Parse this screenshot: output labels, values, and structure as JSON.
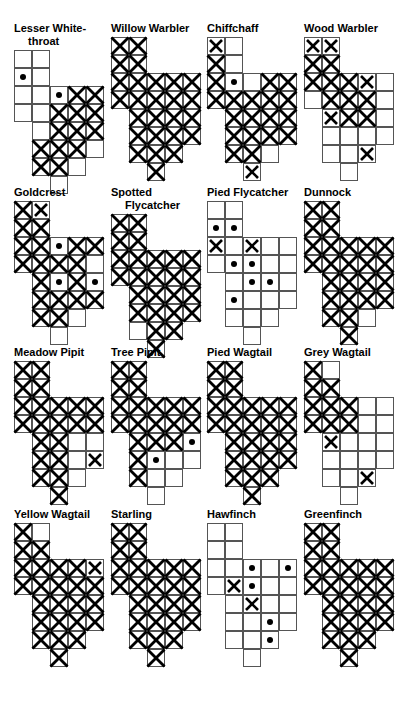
{
  "page": {
    "columns": 4,
    "rows": 4,
    "cell_px": 18,
    "grid_cols": 5,
    "grid_rows": 8,
    "colors": {
      "ink": "#000000",
      "gridline": "#555555",
      "background": "#ffffff"
    },
    "legend": {
      "empty": "absent / no record",
      "dot": "sparse - single dot",
      "cross": "present - single cross",
      "hatch": "abundant - full cross-hatch"
    }
  },
  "grid_shape": [
    [
      1,
      1,
      0,
      0,
      0
    ],
    [
      1,
      1,
      0,
      0,
      0
    ],
    [
      1,
      1,
      1,
      1,
      1
    ],
    [
      1,
      1,
      1,
      1,
      1
    ],
    [
      0,
      1,
      1,
      1,
      1
    ],
    [
      0,
      1,
      1,
      1,
      1
    ],
    [
      0,
      1,
      1,
      1,
      0
    ],
    [
      0,
      0,
      1,
      0,
      0
    ]
  ],
  "chart_data": {
    "type": "heatmap",
    "xlabel": "",
    "ylabel": "",
    "state_values": [
      "empty",
      "dot",
      "cross",
      "hatch"
    ],
    "panels": [
      {
        "name": "Lesser White-throat",
        "label_line1": "Lesser White-",
        "label_line2": "throat",
        "cells": [
          [
            "empty",
            "empty",
            "",
            "",
            ""
          ],
          [
            "dot",
            "empty",
            "",
            "",
            ""
          ],
          [
            "empty",
            "empty",
            "dot",
            "hatch",
            "hatch"
          ],
          [
            "empty",
            "empty",
            "hatch",
            "hatch",
            "hatch"
          ],
          [
            "",
            "empty",
            "hatch",
            "hatch",
            "hatch"
          ],
          [
            "",
            "hatch",
            "hatch",
            "hatch",
            "empty"
          ],
          [
            "",
            "hatch",
            "hatch",
            "empty",
            ""
          ],
          [
            "",
            "",
            "empty",
            "",
            ""
          ]
        ]
      },
      {
        "name": "Willow Warbler",
        "label_line1": "Willow Warbler",
        "label_line2": "",
        "cells": [
          [
            "hatch",
            "hatch",
            "",
            "",
            ""
          ],
          [
            "hatch",
            "hatch",
            "",
            "",
            ""
          ],
          [
            "hatch",
            "hatch",
            "hatch",
            "hatch",
            "hatch"
          ],
          [
            "hatch",
            "hatch",
            "hatch",
            "hatch",
            "hatch"
          ],
          [
            "",
            "hatch",
            "hatch",
            "hatch",
            "hatch"
          ],
          [
            "",
            "hatch",
            "hatch",
            "hatch",
            "hatch"
          ],
          [
            "",
            "hatch",
            "hatch",
            "hatch",
            ""
          ],
          [
            "",
            "",
            "hatch",
            "",
            ""
          ]
        ]
      },
      {
        "name": "Chiffchaff",
        "label_line1": "Chiffchaff",
        "label_line2": "",
        "cells": [
          [
            "cross",
            "empty",
            "",
            "",
            ""
          ],
          [
            "hatch",
            "empty",
            "",
            "",
            ""
          ],
          [
            "hatch",
            "dot",
            "empty",
            "hatch",
            "hatch"
          ],
          [
            "hatch",
            "hatch",
            "hatch",
            "hatch",
            "hatch"
          ],
          [
            "",
            "hatch",
            "hatch",
            "hatch",
            "hatch"
          ],
          [
            "",
            "hatch",
            "hatch",
            "hatch",
            "hatch"
          ],
          [
            "",
            "hatch",
            "hatch",
            "empty",
            ""
          ],
          [
            "",
            "",
            "cross",
            "",
            ""
          ]
        ]
      },
      {
        "name": "Wood Warbler",
        "label_line1": "Wood Warbler",
        "label_line2": "",
        "cells": [
          [
            "cross",
            "cross",
            "",
            "",
            ""
          ],
          [
            "hatch",
            "hatch",
            "",
            "",
            ""
          ],
          [
            "hatch",
            "hatch",
            "hatch",
            "cross",
            "empty"
          ],
          [
            "empty",
            "hatch",
            "hatch",
            "hatch",
            "empty"
          ],
          [
            "",
            "cross",
            "hatch",
            "hatch",
            "empty"
          ],
          [
            "",
            "empty",
            "empty",
            "empty",
            "empty"
          ],
          [
            "",
            "empty",
            "empty",
            "cross",
            ""
          ],
          [
            "",
            "",
            "empty",
            "",
            ""
          ]
        ]
      },
      {
        "name": "Goldcrest",
        "label_line1": "Goldcrest",
        "label_line2": "",
        "cells": [
          [
            "hatch",
            "cross",
            "",
            "",
            ""
          ],
          [
            "hatch",
            "hatch",
            "",
            "",
            ""
          ],
          [
            "hatch",
            "hatch",
            "dot",
            "hatch",
            "hatch"
          ],
          [
            "hatch",
            "hatch",
            "hatch",
            "hatch",
            "empty"
          ],
          [
            "",
            "hatch",
            "dot",
            "hatch",
            "dot"
          ],
          [
            "",
            "hatch",
            "hatch",
            "hatch",
            "hatch"
          ],
          [
            "",
            "hatch",
            "hatch",
            "empty",
            ""
          ],
          [
            "",
            "",
            "empty",
            "",
            ""
          ]
        ]
      },
      {
        "name": "Spotted Flycatcher",
        "label_line1": "Spotted",
        "label_line2": "Flycatcher",
        "cells": [
          [
            "hatch",
            "hatch",
            "",
            "",
            ""
          ],
          [
            "hatch",
            "hatch",
            "",
            "",
            ""
          ],
          [
            "hatch",
            "hatch",
            "hatch",
            "hatch",
            "hatch"
          ],
          [
            "hatch",
            "hatch",
            "hatch",
            "hatch",
            "hatch"
          ],
          [
            "",
            "hatch",
            "hatch",
            "hatch",
            "hatch"
          ],
          [
            "",
            "hatch",
            "hatch",
            "hatch",
            "hatch"
          ],
          [
            "",
            "empty",
            "hatch",
            "hatch",
            ""
          ],
          [
            "",
            "",
            "hatch",
            "",
            ""
          ]
        ]
      },
      {
        "name": "Pied Flycatcher",
        "label_line1": "Pied Flycatcher",
        "label_line2": "",
        "cells": [
          [
            "empty",
            "empty",
            "",
            "",
            ""
          ],
          [
            "dot",
            "dot",
            "",
            "",
            ""
          ],
          [
            "cross",
            "empty",
            "cross",
            "empty",
            "empty"
          ],
          [
            "empty",
            "dot",
            "dot",
            "empty",
            "empty"
          ],
          [
            "",
            "empty",
            "dot",
            "dot",
            "empty"
          ],
          [
            "",
            "dot",
            "empty",
            "empty",
            "empty"
          ],
          [
            "",
            "empty",
            "empty",
            "empty",
            ""
          ],
          [
            "",
            "",
            "empty",
            "",
            ""
          ]
        ]
      },
      {
        "name": "Dunnock",
        "label_line1": "Dunnock",
        "label_line2": "",
        "cells": [
          [
            "hatch",
            "hatch",
            "",
            "",
            ""
          ],
          [
            "hatch",
            "hatch",
            "",
            "",
            ""
          ],
          [
            "hatch",
            "hatch",
            "hatch",
            "hatch",
            "hatch"
          ],
          [
            "hatch",
            "hatch",
            "hatch",
            "hatch",
            "hatch"
          ],
          [
            "",
            "hatch",
            "hatch",
            "hatch",
            "hatch"
          ],
          [
            "",
            "hatch",
            "hatch",
            "hatch",
            "hatch"
          ],
          [
            "",
            "hatch",
            "hatch",
            "empty",
            ""
          ],
          [
            "",
            "",
            "hatch",
            "",
            ""
          ]
        ]
      },
      {
        "name": "Meadow Pipit",
        "label_line1": "Meadow Pipit",
        "label_line2": "",
        "cells": [
          [
            "hatch",
            "hatch",
            "",
            "",
            ""
          ],
          [
            "hatch",
            "hatch",
            "",
            "",
            ""
          ],
          [
            "hatch",
            "hatch",
            "hatch",
            "hatch",
            "hatch"
          ],
          [
            "hatch",
            "hatch",
            "hatch",
            "hatch",
            "hatch"
          ],
          [
            "",
            "hatch",
            "hatch",
            "empty",
            "empty"
          ],
          [
            "",
            "hatch",
            "hatch",
            "empty",
            "cross"
          ],
          [
            "",
            "hatch",
            "hatch",
            "empty",
            ""
          ],
          [
            "",
            "",
            "hatch",
            "",
            ""
          ]
        ]
      },
      {
        "name": "Tree Pipit",
        "label_line1": "Tree Pipit",
        "label_line2": "",
        "cells": [
          [
            "hatch",
            "hatch",
            "",
            "",
            ""
          ],
          [
            "hatch",
            "hatch",
            "",
            "",
            ""
          ],
          [
            "hatch",
            "hatch",
            "hatch",
            "hatch",
            "hatch"
          ],
          [
            "hatch",
            "hatch",
            "hatch",
            "hatch",
            "hatch"
          ],
          [
            "",
            "hatch",
            "hatch",
            "hatch",
            "dot"
          ],
          [
            "",
            "hatch",
            "dot",
            "empty",
            "empty"
          ],
          [
            "",
            "hatch",
            "empty",
            "empty",
            ""
          ],
          [
            "",
            "",
            "empty",
            "",
            ""
          ]
        ]
      },
      {
        "name": "Pied Wagtail",
        "label_line1": "Pied Wagtail",
        "label_line2": "",
        "cells": [
          [
            "hatch",
            "hatch",
            "",
            "",
            ""
          ],
          [
            "hatch",
            "hatch",
            "",
            "",
            ""
          ],
          [
            "hatch",
            "hatch",
            "hatch",
            "hatch",
            "hatch"
          ],
          [
            "hatch",
            "hatch",
            "hatch",
            "hatch",
            "hatch"
          ],
          [
            "",
            "hatch",
            "hatch",
            "hatch",
            "hatch"
          ],
          [
            "",
            "hatch",
            "hatch",
            "hatch",
            "hatch"
          ],
          [
            "",
            "hatch",
            "hatch",
            "hatch",
            ""
          ],
          [
            "",
            "",
            "hatch",
            "",
            ""
          ]
        ]
      },
      {
        "name": "Grey Wagtail",
        "label_line1": "Grey Wagtail",
        "label_line2": "",
        "cells": [
          [
            "hatch",
            "empty",
            "",
            "",
            ""
          ],
          [
            "hatch",
            "hatch",
            "",
            "",
            ""
          ],
          [
            "hatch",
            "hatch",
            "hatch",
            "empty",
            "empty"
          ],
          [
            "hatch",
            "hatch",
            "hatch",
            "empty",
            "empty"
          ],
          [
            "",
            "cross",
            "empty",
            "empty",
            "empty"
          ],
          [
            "",
            "empty",
            "empty",
            "empty",
            "empty"
          ],
          [
            "",
            "empty",
            "empty",
            "cross",
            ""
          ],
          [
            "",
            "",
            "empty",
            "",
            ""
          ]
        ]
      },
      {
        "name": "Yellow Wagtail",
        "label_line1": "Yellow Wagtail",
        "label_line2": "",
        "cells": [
          [
            "hatch",
            "empty",
            "",
            "",
            ""
          ],
          [
            "hatch",
            "hatch",
            "",
            "",
            ""
          ],
          [
            "hatch",
            "hatch",
            "hatch",
            "hatch",
            "cross"
          ],
          [
            "hatch",
            "hatch",
            "hatch",
            "hatch",
            "hatch"
          ],
          [
            "",
            "hatch",
            "hatch",
            "hatch",
            "hatch"
          ],
          [
            "",
            "hatch",
            "hatch",
            "hatch",
            "hatch"
          ],
          [
            "",
            "hatch",
            "hatch",
            "hatch",
            ""
          ],
          [
            "",
            "",
            "hatch",
            "",
            ""
          ]
        ]
      },
      {
        "name": "Starling",
        "label_line1": "Starling",
        "label_line2": "",
        "cells": [
          [
            "hatch",
            "hatch",
            "",
            "",
            ""
          ],
          [
            "hatch",
            "hatch",
            "",
            "",
            ""
          ],
          [
            "hatch",
            "hatch",
            "hatch",
            "hatch",
            "hatch"
          ],
          [
            "hatch",
            "hatch",
            "hatch",
            "hatch",
            "hatch"
          ],
          [
            "",
            "hatch",
            "hatch",
            "hatch",
            "hatch"
          ],
          [
            "",
            "hatch",
            "hatch",
            "hatch",
            "hatch"
          ],
          [
            "",
            "hatch",
            "hatch",
            "hatch",
            ""
          ],
          [
            "",
            "",
            "hatch",
            "",
            ""
          ]
        ]
      },
      {
        "name": "Hawfinch",
        "label_line1": "Hawfinch",
        "label_line2": "",
        "cells": [
          [
            "empty",
            "empty",
            "",
            "",
            ""
          ],
          [
            "empty",
            "empty",
            "",
            "",
            ""
          ],
          [
            "empty",
            "empty",
            "dot",
            "empty",
            "dot"
          ],
          [
            "empty",
            "cross",
            "dot",
            "empty",
            "empty"
          ],
          [
            "",
            "empty",
            "cross",
            "empty",
            "empty"
          ],
          [
            "",
            "empty",
            "empty",
            "dot",
            "empty"
          ],
          [
            "",
            "empty",
            "empty",
            "dot",
            ""
          ],
          [
            "",
            "",
            "empty",
            "",
            ""
          ]
        ]
      },
      {
        "name": "Greenfinch",
        "label_line1": "Greenfinch",
        "label_line2": "",
        "cells": [
          [
            "hatch",
            "hatch",
            "",
            "",
            ""
          ],
          [
            "hatch",
            "hatch",
            "",
            "",
            ""
          ],
          [
            "hatch",
            "hatch",
            "hatch",
            "hatch",
            "hatch"
          ],
          [
            "hatch",
            "hatch",
            "hatch",
            "hatch",
            "hatch"
          ],
          [
            "",
            "hatch",
            "hatch",
            "hatch",
            "hatch"
          ],
          [
            "",
            "hatch",
            "hatch",
            "hatch",
            "hatch"
          ],
          [
            "",
            "hatch",
            "hatch",
            "hatch",
            ""
          ],
          [
            "",
            "",
            "hatch",
            "",
            ""
          ]
        ]
      }
    ]
  }
}
